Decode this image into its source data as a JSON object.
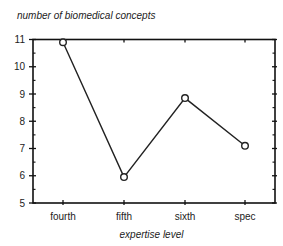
{
  "chart_data": {
    "type": "line",
    "title": "",
    "ylabel": "number of biomedical concepts",
    "xlabel": "expertise level",
    "categories": [
      "fourth",
      "fifth",
      "sixth",
      "spec"
    ],
    "series": [
      {
        "name": "number of biomedical concepts",
        "values": [
          10.9,
          5.95,
          8.85,
          7.1
        ],
        "marker": "open-circle",
        "color": "#222222"
      }
    ],
    "ylim": [
      5,
      11
    ],
    "yticks": [
      5,
      6,
      7,
      8,
      9,
      10,
      11
    ],
    "grid": false,
    "legend": null
  },
  "labels": {
    "ylabel": "number of biomedical concepts",
    "xlabel": "expertise level"
  }
}
